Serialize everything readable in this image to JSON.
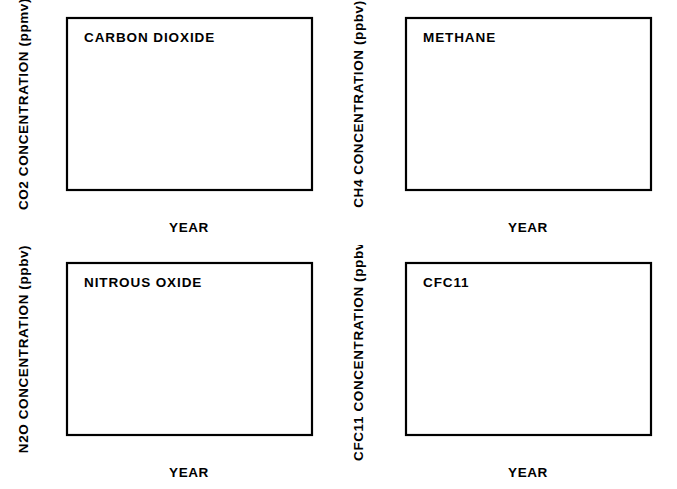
{
  "figure": {
    "background": "#ffffff",
    "ink": "#000000",
    "layout": "2x2 grid of line charts"
  },
  "chart_data": [
    {
      "type": "line",
      "id": "carbon-dioxide",
      "title": "CARBON  DIOXIDE",
      "xlabel": "YEAR",
      "ylabel": "CO2  CONCENTRATION  (ppmv)",
      "xlim": [
        1750,
        2000
      ],
      "ylim": [
        260,
        360
      ],
      "xticks": [
        1750,
        1800,
        1850,
        1900,
        1950,
        2000
      ],
      "xtick_labels": [
        "1750",
        "1800",
        "1850",
        "1900",
        "1950",
        "2000"
      ],
      "yticks": [
        260,
        280,
        300,
        320,
        340,
        360
      ],
      "ytick_labels": [
        "260",
        "280",
        "300",
        "320",
        "340",
        "360"
      ],
      "minor_x_step": 25,
      "minor_y_step": 10,
      "grid": false,
      "legend": "none",
      "series": [
        {
          "name": "CO2",
          "x": [
            1765,
            1785,
            1805,
            1825,
            1845,
            1865,
            1885,
            1900,
            1915,
            1930,
            1945,
            1958,
            1968,
            1978,
            1985,
            1990
          ],
          "values": [
            279,
            279.5,
            280.5,
            281.5,
            283,
            285,
            288,
            295.5,
            300,
            304,
            308,
            315,
            323,
            334,
            345,
            353
          ]
        }
      ]
    },
    {
      "type": "line",
      "id": "methane",
      "title": "METHANE",
      "xlabel": "YEAR",
      "ylabel": "CH4  CONCENTRATION  (ppbv)",
      "xlim": [
        1750,
        2000
      ],
      "ylim": [
        600,
        1800
      ],
      "xticks": [
        1750,
        1800,
        1850,
        1900,
        1950,
        2000
      ],
      "xtick_labels": [
        "1750",
        "1800",
        "1850",
        "1900",
        "1950",
        "2000"
      ],
      "yticks": [
        600,
        800,
        1000,
        1200,
        1400,
        1600,
        1800
      ],
      "ytick_labels": [
        "600",
        "800",
        "1000",
        "1200",
        "1400",
        "1600",
        "1800"
      ],
      "minor_x_step": 25,
      "minor_y_step": 100,
      "grid": false,
      "legend": "none",
      "series": [
        {
          "name": "CH4",
          "x": [
            1765,
            1785,
            1800,
            1820,
            1840,
            1860,
            1880,
            1900,
            1920,
            1935,
            1950,
            1960,
            1970,
            1980,
            1990
          ],
          "values": [
            795,
            797,
            800,
            830,
            860,
            890,
            925,
            975,
            1030,
            1090,
            1150,
            1270,
            1410,
            1560,
            1710
          ]
        }
      ]
    },
    {
      "type": "line",
      "id": "nitrous-oxide",
      "title": "NITROUS  OXIDE",
      "xlabel": "YEAR",
      "ylabel": "N2O  CONCENTRATION  (ppbv)",
      "xlim": [
        1750,
        2000
      ],
      "ylim": [
        280,
        310
      ],
      "xticks": [
        1750,
        1800,
        1850,
        1900,
        1950,
        2000
      ],
      "xtick_labels": [
        "1750",
        "1800",
        "1850",
        "1900",
        "1950",
        "2000"
      ],
      "yticks": [
        280,
        290,
        300,
        310
      ],
      "ytick_labels": [
        "280",
        "290",
        "300",
        "310"
      ],
      "minor_x_step": 25,
      "minor_y_step": 5,
      "grid": false,
      "legend": "none",
      "series": [
        {
          "name": "N2O",
          "x": [
            1750,
            1770,
            1800,
            1830,
            1860,
            1890,
            1920,
            1950,
            1962,
            1972,
            1980,
            1986,
            1990
          ],
          "values": [
            285,
            285.3,
            286.3,
            287.5,
            289,
            290.7,
            292.6,
            294.5,
            296.3,
            299.5,
            302.5,
            306,
            310
          ]
        }
      ]
    },
    {
      "type": "line",
      "id": "cfc11",
      "title": "CFC11",
      "xlabel": "YEAR",
      "ylabel": "CFC11  CONCENTRATION  (ppbv)",
      "xlim": [
        1750,
        2000
      ],
      "ylim": [
        0.0,
        0.3
      ],
      "xticks": [
        1750,
        1800,
        1850,
        1900,
        1950,
        2000
      ],
      "xtick_labels": [
        "1750",
        "1800",
        "1850",
        "1900",
        "1950",
        "2000"
      ],
      "yticks": [
        0.0,
        0.1,
        0.2,
        0.3
      ],
      "ytick_labels": [
        "0.0",
        "0.1",
        "0.2",
        "0.3"
      ],
      "minor_x_step": 25,
      "minor_y_step": 0.05,
      "grid": false,
      "legend": "none",
      "series": [
        {
          "name": "CFC11",
          "x": [
            1750,
            1900,
            1945,
            1952,
            1958,
            1964,
            1970,
            1975,
            1980,
            1985,
            1988,
            1990
          ],
          "values": [
            0.0,
            0.0,
            0.0,
            0.004,
            0.012,
            0.03,
            0.06,
            0.098,
            0.15,
            0.205,
            0.25,
            0.277
          ]
        }
      ]
    }
  ]
}
